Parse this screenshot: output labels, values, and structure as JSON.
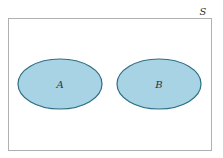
{
  "diagram": {
    "type": "venn",
    "sample_space": {
      "label": "S"
    },
    "sets": [
      {
        "label": "A"
      },
      {
        "label": "B"
      }
    ],
    "colors": {
      "set_fill": "#a7d3e4",
      "set_stroke": "#2f6f85",
      "border": "#b0b0b0",
      "text": "#333333"
    }
  }
}
